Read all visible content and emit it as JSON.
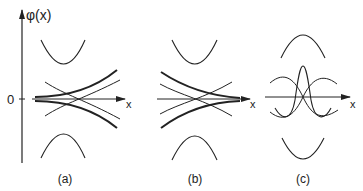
{
  "figure": {
    "y_axis_label": "φ(x)",
    "origin_label": "0",
    "x_axis_label": "x",
    "panels": [
      {
        "id": "a",
        "caption": "(a)"
      },
      {
        "id": "b",
        "caption": "(b)"
      },
      {
        "id": "c",
        "caption": "(c)"
      }
    ]
  },
  "colors": {
    "line": "#222222",
    "background": "#ffffff"
  }
}
